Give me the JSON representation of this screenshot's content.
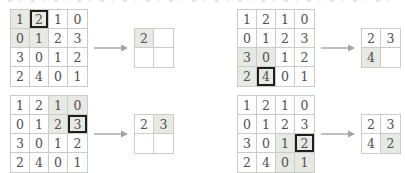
{
  "figure": {
    "kind": "max-pooling-diagram",
    "pooling_window": "2x2",
    "arrow_icon": "arrow-right"
  },
  "colors": {
    "cell_shaded": "#e7e9e3",
    "grid_line": "#c9cdc9",
    "digit": "#505050",
    "bold_border": "#1f1f1f",
    "arrow": "#a3a3a3"
  },
  "examples": [
    {
      "position": "top-left",
      "input": [
        [
          {
            "v": "1",
            "s": 1
          },
          {
            "v": "2",
            "s": 1,
            "b": 1
          },
          {
            "v": "1"
          },
          {
            "v": "0"
          }
        ],
        [
          {
            "v": "0",
            "s": 1
          },
          {
            "v": "1",
            "s": 1
          },
          {
            "v": "2"
          },
          {
            "v": "3"
          }
        ],
        [
          {
            "v": "3"
          },
          {
            "v": "0"
          },
          {
            "v": "1"
          },
          {
            "v": "2"
          }
        ],
        [
          {
            "v": "2"
          },
          {
            "v": "4"
          },
          {
            "v": "0"
          },
          {
            "v": "1"
          }
        ]
      ],
      "output": [
        [
          {
            "v": "2",
            "s": 1
          },
          {
            "v": ""
          }
        ],
        [
          {
            "v": ""
          },
          {
            "v": ""
          }
        ]
      ]
    },
    {
      "position": "top-right",
      "input": [
        [
          {
            "v": "1"
          },
          {
            "v": "2"
          },
          {
            "v": "1"
          },
          {
            "v": "0"
          }
        ],
        [
          {
            "v": "0"
          },
          {
            "v": "1"
          },
          {
            "v": "2"
          },
          {
            "v": "3"
          }
        ],
        [
          {
            "v": "3",
            "s": 1
          },
          {
            "v": "0",
            "s": 1
          },
          {
            "v": "1"
          },
          {
            "v": "2"
          }
        ],
        [
          {
            "v": "2",
            "s": 1
          },
          {
            "v": "4",
            "s": 1,
            "b": 1
          },
          {
            "v": "0"
          },
          {
            "v": "1"
          }
        ]
      ],
      "output": [
        [
          {
            "v": "2"
          },
          {
            "v": "3"
          }
        ],
        [
          {
            "v": "4",
            "s": 1
          },
          {
            "v": ""
          }
        ]
      ]
    },
    {
      "position": "bottom-left",
      "input": [
        [
          {
            "v": "1"
          },
          {
            "v": "2"
          },
          {
            "v": "1",
            "s": 1
          },
          {
            "v": "0",
            "s": 1
          }
        ],
        [
          {
            "v": "0"
          },
          {
            "v": "1"
          },
          {
            "v": "2",
            "s": 1
          },
          {
            "v": "3",
            "s": 1,
            "b": 1
          }
        ],
        [
          {
            "v": "3"
          },
          {
            "v": "0"
          },
          {
            "v": "1"
          },
          {
            "v": "2"
          }
        ],
        [
          {
            "v": "2"
          },
          {
            "v": "4"
          },
          {
            "v": "0"
          },
          {
            "v": "1"
          }
        ]
      ],
      "output": [
        [
          {
            "v": "2"
          },
          {
            "v": "3",
            "s": 1
          }
        ],
        [
          {
            "v": ""
          },
          {
            "v": ""
          }
        ]
      ]
    },
    {
      "position": "bottom-right",
      "input": [
        [
          {
            "v": "1"
          },
          {
            "v": "2"
          },
          {
            "v": "1"
          },
          {
            "v": "0"
          }
        ],
        [
          {
            "v": "0"
          },
          {
            "v": "1"
          },
          {
            "v": "2"
          },
          {
            "v": "3"
          }
        ],
        [
          {
            "v": "3"
          },
          {
            "v": "0"
          },
          {
            "v": "1",
            "s": 1
          },
          {
            "v": "2",
            "s": 1,
            "b": 1
          }
        ],
        [
          {
            "v": "2"
          },
          {
            "v": "4"
          },
          {
            "v": "0",
            "s": 1
          },
          {
            "v": "1",
            "s": 1
          }
        ]
      ],
      "output": [
        [
          {
            "v": "2"
          },
          {
            "v": "3"
          }
        ],
        [
          {
            "v": "4"
          },
          {
            "v": "2",
            "s": 1
          }
        ]
      ]
    }
  ]
}
